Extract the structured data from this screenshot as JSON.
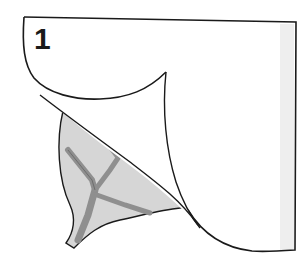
{
  "diagram": {
    "step_number": "1",
    "elements": [
      {
        "name": "paper-sheet",
        "fill": "#ffffff",
        "stroke": "#1a1a1a"
      },
      {
        "name": "peeled-flap",
        "fill": "#ffffff",
        "stroke": "#1a1a1a"
      },
      {
        "name": "leaf",
        "fill": "#d6d6d6",
        "stroke": "#1a1a1a"
      },
      {
        "name": "leaf-veins",
        "fill": "#8f8f8f"
      }
    ],
    "colors": {
      "outline": "#1a1a1a",
      "paper": "#ffffff",
      "paper_shade": "#eeeeee",
      "leaf": "#d6d6d6",
      "vein": "#8f8f8f"
    }
  }
}
